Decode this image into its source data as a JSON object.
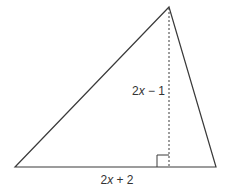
{
  "figure": {
    "type": "triangle-with-altitude",
    "colors": {
      "stroke": "#3a3a3a",
      "text": "#333333",
      "background": "#ffffff"
    },
    "vertices": {
      "top": [
        169,
        7
      ],
      "bottom_left": [
        15,
        167
      ],
      "bottom_right": [
        216,
        167
      ]
    },
    "altitude": {
      "from": [
        169,
        7
      ],
      "to": [
        169,
        167
      ],
      "style": "dashed"
    },
    "right_angle_marker": {
      "x": 157,
      "y": 155,
      "size": 12
    },
    "labels": {
      "height": {
        "coef": "2",
        "var": "x",
        "rest": " − 1"
      },
      "base": {
        "coef": "2",
        "var": "x",
        "rest": " + 2"
      }
    }
  }
}
